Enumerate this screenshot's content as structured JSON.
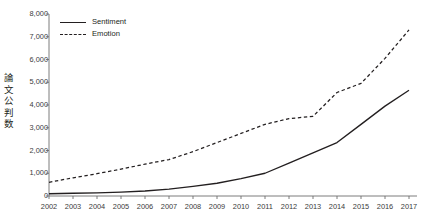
{
  "chart_data": {
    "type": "line",
    "title": "",
    "xlabel": "",
    "ylabel": "論文公判数",
    "ylabel_chars": "論\n文\n公\n判\n数",
    "x": [
      2002,
      2003,
      2004,
      2005,
      2006,
      2007,
      2008,
      2009,
      2010,
      2011,
      2012,
      2013,
      2014,
      2015,
      2016,
      2017
    ],
    "categories": [
      "2002",
      "2003",
      "2004",
      "2005",
      "2006",
      "2007",
      "2008",
      "2009",
      "2010",
      "2011",
      "2012",
      "2013",
      "2014",
      "2015",
      "2016",
      "2017"
    ],
    "series": [
      {
        "name": "Sentiment",
        "style": "solid",
        "color": "#231f20",
        "values": [
          100,
          120,
          140,
          170,
          220,
          300,
          420,
          560,
          760,
          1000,
          1450,
          1900,
          2350,
          3150,
          3950,
          4650
        ]
      },
      {
        "name": "Emotion",
        "style": "dashed",
        "color": "#231f20",
        "values": [
          600,
          800,
          980,
          1180,
          1400,
          1600,
          1950,
          2350,
          2750,
          3150,
          3400,
          3500,
          4550,
          4950,
          6050,
          7300
        ]
      }
    ],
    "ylim": [
      0,
      8000
    ],
    "yticks": [
      0,
      1000,
      2000,
      3000,
      4000,
      5000,
      6000,
      7000,
      8000
    ],
    "ytick_labels": [
      "0",
      "1,000",
      "2,000",
      "3,000",
      "4,000",
      "5,000",
      "6,000",
      "7,000",
      "8,000"
    ],
    "xlim": [
      2002,
      2017
    ],
    "grid": false,
    "legend_position": "top-left",
    "legend_entries": [
      "Sentiment",
      "Emotion"
    ]
  }
}
